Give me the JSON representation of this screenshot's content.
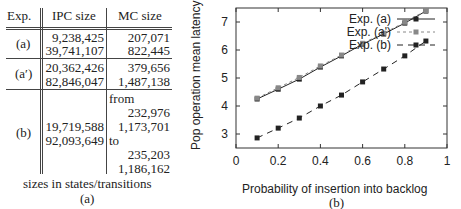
{
  "table": {
    "headers": {
      "exp": "Exp.",
      "ipc": "IPC size",
      "mc": "MC size"
    },
    "rows": [
      {
        "exp": "(a)",
        "ipc": [
          "9,238,425",
          "39,741,107"
        ],
        "mc": [
          "207,071",
          "822,445"
        ]
      },
      {
        "exp": "(a′)",
        "ipc": [
          "20,362,426",
          "82,846,047"
        ],
        "mc": [
          "379,656",
          "1,487,138"
        ]
      },
      {
        "exp": "(b)",
        "ipc": [
          "19,719,588",
          "92,093,649"
        ],
        "mc_from_label": "from",
        "mc_from": [
          "232,976",
          "1,173,701"
        ],
        "mc_to_label": "to",
        "mc_to": [
          "235,203",
          "1,186,162"
        ]
      }
    ],
    "caption": "sizes in states/transitions",
    "sublabel": "(a)"
  },
  "chart_data": {
    "type": "line",
    "title": "",
    "xlabel": "Probability of insertion into backlog",
    "ylabel": "Pop operation mean latency",
    "sublabel": "(b)",
    "xlim": [
      0,
      1
    ],
    "ylim": [
      2.5,
      7.5
    ],
    "xticks": [
      "0",
      "0.2",
      "0.4",
      "0.6",
      "0.8",
      "1"
    ],
    "yticks": [
      "3",
      "4",
      "5",
      "6",
      "7"
    ],
    "grid": false,
    "legend_position": "top-left inside",
    "x": [
      0.1,
      0.2,
      0.3,
      0.4,
      0.5,
      0.6,
      0.7,
      0.8,
      0.9
    ],
    "series": [
      {
        "name": "Exp. (a)",
        "style": "solid",
        "color": "#222222",
        "values": [
          4.25,
          4.6,
          4.96,
          5.39,
          5.79,
          6.21,
          6.57,
          6.96,
          7.39
        ]
      },
      {
        "name": "Exp. (a')",
        "style": "dotted",
        "color": "#888888",
        "values": [
          4.28,
          4.65,
          5.02,
          5.43,
          5.82,
          6.24,
          6.6,
          6.99,
          7.41
        ]
      },
      {
        "name": "Exp. (b)",
        "style": "dashed",
        "color": "#222222",
        "values": [
          2.86,
          3.21,
          3.57,
          4.0,
          4.39,
          4.86,
          5.32,
          5.79,
          6.32
        ]
      }
    ]
  }
}
